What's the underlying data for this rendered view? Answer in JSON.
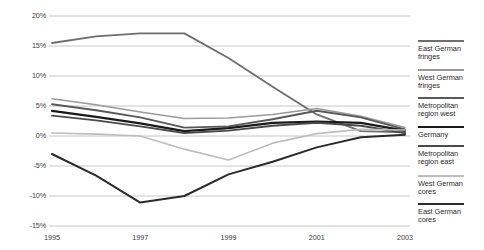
{
  "chart_data": {
    "type": "line",
    "title": "",
    "subtitle": "",
    "xlabel": "",
    "ylabel": "",
    "grid": true,
    "legend_position": "right",
    "x": [
      1995,
      1996,
      1997,
      1998,
      1999,
      2000,
      2001,
      2002,
      2003
    ],
    "xticks": [
      "1995",
      "1997",
      "1999",
      "2001",
      "2003"
    ],
    "xtick_values": [
      1995,
      1997,
      1999,
      2001,
      2003
    ],
    "xlim": [
      1995,
      2003
    ],
    "yticks": [
      "20%",
      "15%",
      "10%",
      "5%",
      "0%",
      "-5%",
      "-10%",
      "-15%"
    ],
    "ytick_values": [
      20,
      15,
      10,
      5,
      0,
      -5,
      -10,
      -15
    ],
    "ylim": [
      -15,
      20
    ],
    "series": [
      {
        "name": "East German fringes",
        "label": "East German\nfringes",
        "color": "#6e6e6e",
        "width": 1.8,
        "values": [
          15.5,
          16.6,
          17.1,
          17.1,
          13.0,
          8.2,
          3.6,
          0.8,
          0.6
        ]
      },
      {
        "name": "West German fringes",
        "label": "West German\nfringes",
        "color": "#9a9a9a",
        "width": 1.5,
        "values": [
          6.2,
          5.2,
          4.0,
          2.9,
          3.0,
          3.6,
          4.6,
          3.3,
          1.4
        ]
      },
      {
        "name": "Metropolitan region west",
        "label": "Metropolitan\nregion west",
        "color": "#595959",
        "width": 1.9,
        "values": [
          5.3,
          4.3,
          3.1,
          1.4,
          1.6,
          2.8,
          4.2,
          3.1,
          1.1
        ]
      },
      {
        "name": "Germany",
        "label": "Germany",
        "color": "#1a1a1a",
        "width": 2.2,
        "values": [
          4.2,
          3.2,
          2.1,
          0.8,
          1.3,
          2.2,
          2.4,
          2.2,
          0.9
        ]
      },
      {
        "name": "Metropolitan region east",
        "label": "Metropolitan\nregion east",
        "color": "#4a4a4a",
        "width": 1.9,
        "values": [
          3.4,
          2.6,
          1.6,
          0.5,
          0.9,
          1.7,
          2.2,
          1.7,
          0.5
        ]
      },
      {
        "name": "West German cores",
        "label": "West German\ncores",
        "color": "#bdbdbd",
        "width": 1.7,
        "values": [
          0.5,
          0.3,
          0.0,
          -2.2,
          -4.0,
          -1.2,
          0.4,
          1.1,
          1.0
        ]
      },
      {
        "name": "East German cores",
        "label": "East German\ncores",
        "color": "#2a2a2a",
        "width": 2.0,
        "values": [
          -3.0,
          -6.6,
          -11.1,
          -10.0,
          -6.4,
          -4.3,
          -1.9,
          -0.2,
          0.2
        ]
      }
    ]
  },
  "axis": {
    "y_tick_labels": [
      "20%",
      "15%",
      "10%",
      "5%",
      "0%",
      "-5%",
      "-10%",
      "-15%"
    ],
    "x_tick_labels": [
      "1995",
      "1997",
      "1999",
      "2001",
      "2003"
    ]
  },
  "legend": {
    "items": [
      {
        "label": "East German\nfringes",
        "color": "#6e6e6e",
        "weight": 2
      },
      {
        "label": "West German\nfringes",
        "color": "#9a9a9a",
        "weight": 2
      },
      {
        "label": "Metropolitan\nregion west",
        "color": "#595959",
        "weight": 2
      },
      {
        "label": "Germany",
        "color": "#1a1a1a",
        "weight": 2.4
      },
      {
        "label": "Metropolitan\nregion east",
        "color": "#4a4a4a",
        "weight": 2
      },
      {
        "label": "West German\ncores",
        "color": "#bdbdbd",
        "weight": 2
      },
      {
        "label": "East German\ncores",
        "color": "#2a2a2a",
        "weight": 2.4
      }
    ]
  },
  "colors": {
    "gridline": "#b7b7b7",
    "text": "#3a3a3a",
    "background": "#ffffff"
  }
}
